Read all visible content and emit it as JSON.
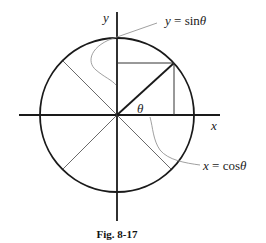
{
  "figure": {
    "caption": "Fig. 8-17",
    "axes": {
      "x_label": "x",
      "y_label": "y"
    },
    "angle_label": "θ",
    "annotations": {
      "sin_label_lhs": "y",
      "sin_label_eq": " = ",
      "sin_label_fn": "sin",
      "sin_label_arg": "θ",
      "cos_label_lhs": "x",
      "cos_label_eq": " = ",
      "cos_label_fn": "cos",
      "cos_label_arg": "θ"
    },
    "colors": {
      "stroke_dark": "#1a1a1a",
      "stroke_thin": "#444444",
      "leader": "#888888",
      "background": "#ffffff"
    }
  }
}
